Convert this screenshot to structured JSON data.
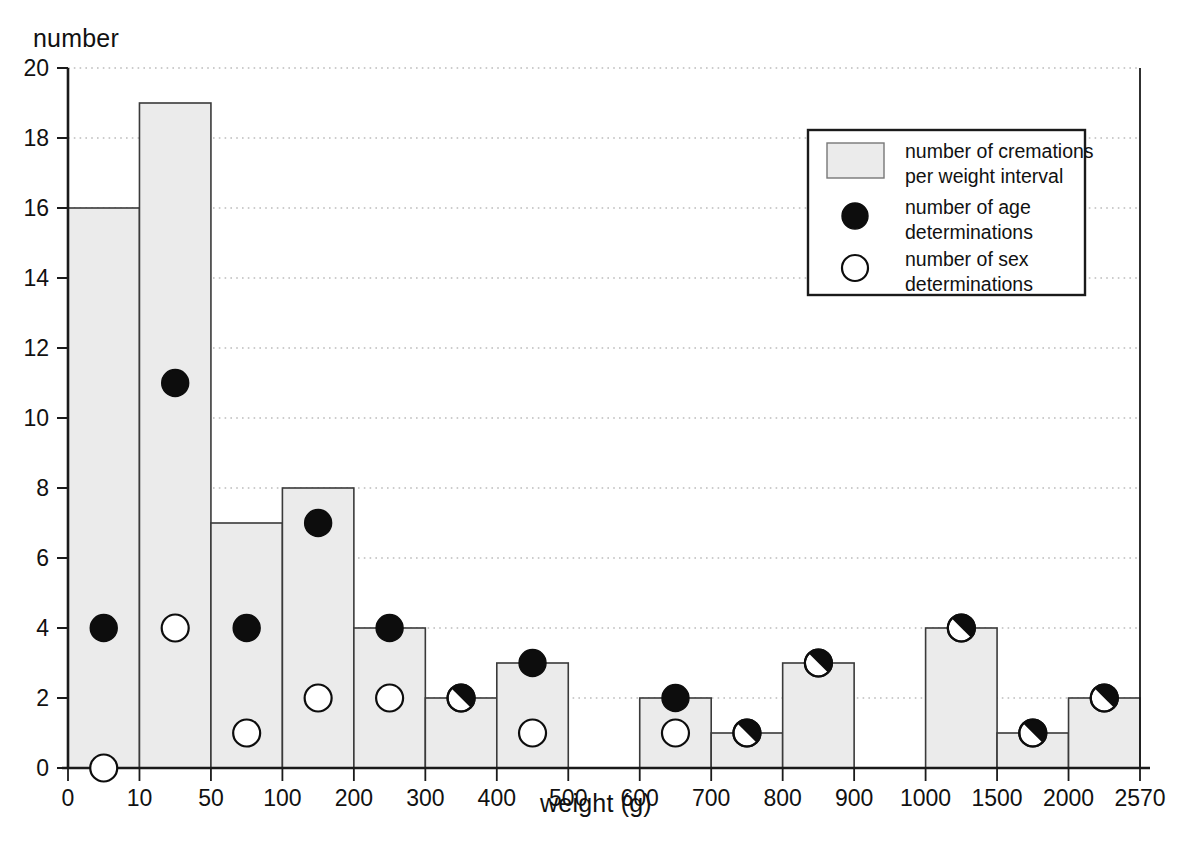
{
  "chart_data": {
    "type": "bar",
    "title": "",
    "ylabel": "number",
    "xlabel": "weight (g)",
    "ylim": [
      0,
      20
    ],
    "ytick_step": 2,
    "yticks": [
      "0",
      "2",
      "4",
      "6",
      "8",
      "10",
      "12",
      "14",
      "16",
      "18",
      "20"
    ],
    "grid": true,
    "grid_style": "dotted-horizontal",
    "edges": [
      "0",
      "10",
      "50",
      "100",
      "200",
      "300",
      "400",
      "500",
      "600",
      "700",
      "800",
      "900",
      "1000",
      "1500",
      "2000",
      "2570"
    ],
    "categories": [
      "0-10",
      "10-50",
      "50-100",
      "100-200",
      "200-300",
      "300-400",
      "400-500",
      "500-600",
      "600-700",
      "700-800",
      "800-900",
      "900-1000",
      "1000-1500",
      "1500-2000",
      "2000-2570"
    ],
    "series": [
      {
        "name": "number of cremations per weight interval",
        "marker": "bar",
        "values": [
          16,
          19,
          7,
          8,
          4,
          2,
          3,
          0,
          2,
          1,
          3,
          0,
          4,
          1,
          2
        ]
      },
      {
        "name": "number of age determinations",
        "marker": "filled-circle",
        "values": [
          4,
          11,
          4,
          7,
          4,
          2,
          3,
          null,
          2,
          1,
          3,
          null,
          4,
          1,
          2
        ]
      },
      {
        "name": "number of sex determinations",
        "marker": "open-circle",
        "values": [
          0,
          4,
          1,
          2,
          2,
          2,
          1,
          null,
          1,
          1,
          3,
          null,
          4,
          1,
          2
        ]
      }
    ],
    "overlapping_bins": [
      "300-400",
      "700-800",
      "800-900",
      "1000-1500",
      "1500-2000",
      "2000-2570"
    ],
    "colors": {
      "bar_fill": "#ebebeb",
      "bar_stroke": "#3a3a3a",
      "age_marker": "#0d0d0d",
      "sex_marker": "#ffffff",
      "axis": "#1a1a1a",
      "grid": "#9a9a9a",
      "background": "#ffffff"
    }
  },
  "legend": {
    "position": "top-right",
    "items": [
      {
        "swatch": "bar-swatch",
        "line1": "number of cremations",
        "line2": "per weight interval"
      },
      {
        "swatch": "filled-circle-swatch",
        "line1": "number of age",
        "line2": "determinations"
      },
      {
        "swatch": "open-circle-swatch",
        "line1": "number of sex",
        "line2": "determinations"
      }
    ]
  },
  "caption": ""
}
